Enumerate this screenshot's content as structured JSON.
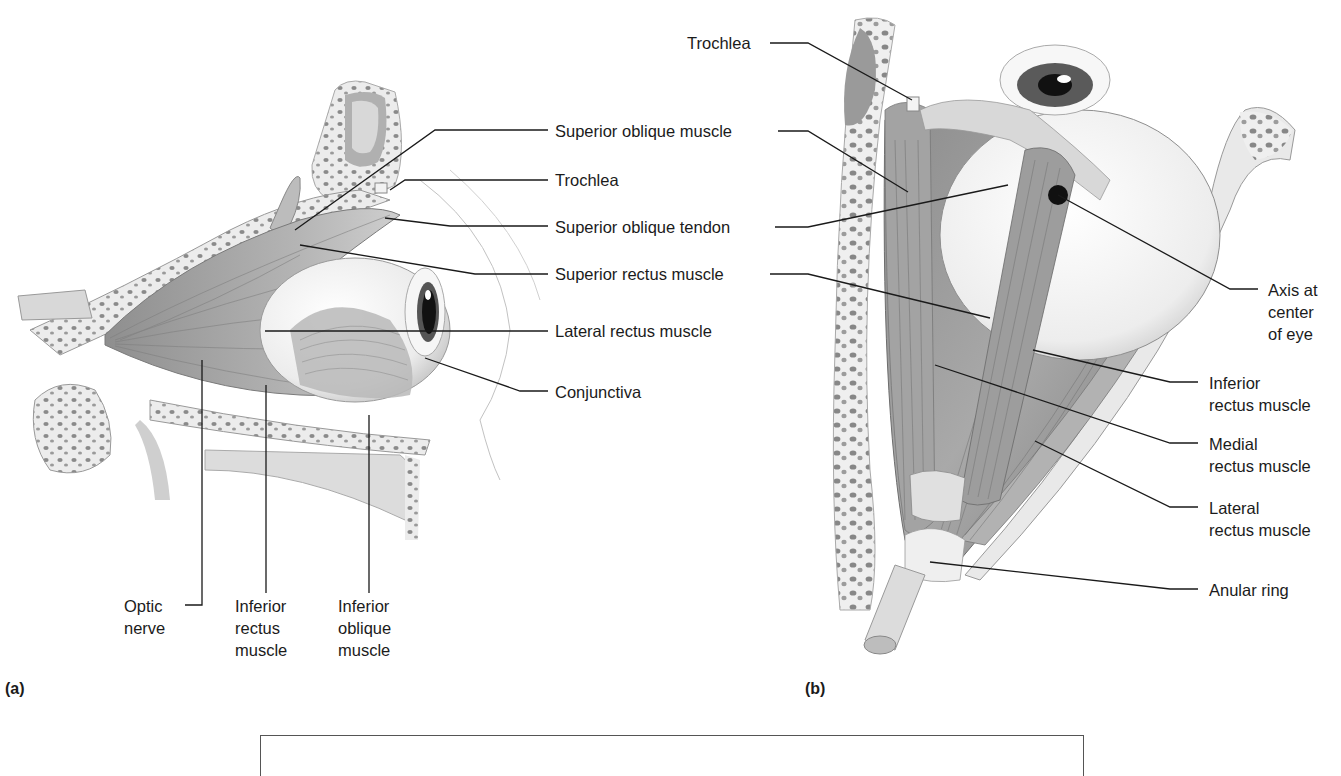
{
  "figure": {
    "panel_a": {
      "tag": "(a)",
      "labels": {
        "superior_oblique_muscle": "Superior oblique muscle",
        "trochlea": "Trochlea",
        "superior_oblique_tendon": "Superior oblique tendon",
        "superior_rectus_muscle": "Superior rectus muscle",
        "lateral_rectus_muscle": "Lateral rectus muscle",
        "conjunctiva": "Conjunctiva",
        "optic_nerve": [
          "Optic",
          "nerve"
        ],
        "inferior_rectus_muscle": [
          "Inferior",
          "rectus",
          "muscle"
        ],
        "inferior_oblique_muscle": [
          "Inferior",
          "oblique",
          "muscle"
        ]
      }
    },
    "panel_b": {
      "tag": "(b)",
      "labels": {
        "trochlea": "Trochlea",
        "axis_at_center_of_eye": [
          "Axis at",
          "center",
          "of eye"
        ],
        "inferior_rectus_muscle": [
          "Inferior",
          "rectus muscle"
        ],
        "medial_rectus_muscle": [
          "Medial",
          "rectus muscle"
        ],
        "lateral_rectus_muscle": [
          "Lateral",
          "rectus muscle"
        ],
        "anular_ring": "Anular ring"
      }
    },
    "colors": {
      "leader_line": "#1a1a1a",
      "muscle_mid": "#9a9a9a",
      "muscle_dark": "#6e6e6e",
      "bone_light": "#e6e6e6",
      "bone_pore": "#8a8a8a",
      "iris": "#555555",
      "pupil": "#111111"
    }
  }
}
